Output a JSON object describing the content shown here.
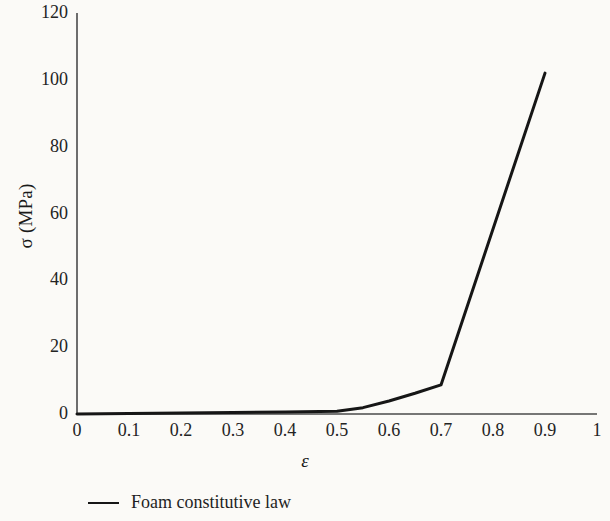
{
  "chart_data": {
    "type": "line",
    "title": "",
    "subtitle": "",
    "xlabel": "ε",
    "ylabel": "σ (MPa)",
    "xlim": [
      0,
      1
    ],
    "ylim": [
      0,
      120
    ],
    "grid": false,
    "legend_position": "below-plot",
    "x_ticks": [
      "0",
      "0.1",
      "0.2",
      "0.3",
      "0.4",
      "0.5",
      "0.6",
      "0.7",
      "0.8",
      "0.9",
      "1"
    ],
    "x_tick_values": [
      0,
      0.1,
      0.2,
      0.3,
      0.4,
      0.5,
      0.6,
      0.7,
      0.8,
      0.9,
      1
    ],
    "y_ticks": [
      "0",
      "20",
      "40",
      "60",
      "80",
      "100",
      "120"
    ],
    "y_tick_values": [
      0,
      20,
      40,
      60,
      80,
      100,
      120
    ],
    "series": [
      {
        "name": "Foam constitutive law",
        "color": "#161616",
        "linewidth": 3,
        "x": [
          0,
          0.1,
          0.2,
          0.3,
          0.4,
          0.5,
          0.55,
          0.6,
          0.65,
          0.7,
          0.9
        ],
        "y": [
          0,
          0.15,
          0.3,
          0.45,
          0.6,
          0.8,
          1.9,
          3.9,
          6.2,
          8.7,
          102
        ]
      }
    ]
  },
  "legend": {
    "entries": [
      {
        "label": "Foam constitutive law",
        "swatch": "line-swatch"
      }
    ]
  },
  "axes": {
    "y_axis_title": "σ (MPa)",
    "x_axis_title": "ε"
  }
}
